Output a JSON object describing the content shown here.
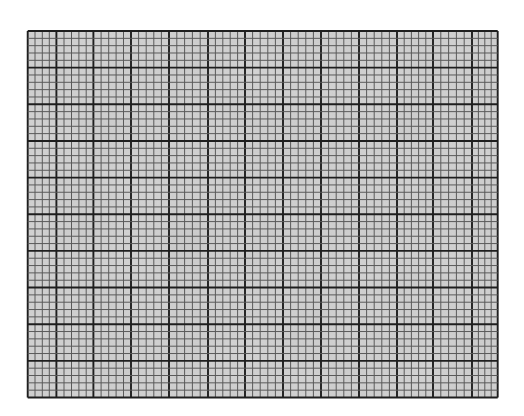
{
  "graph_paper": {
    "background": "#ffffff",
    "grid": {
      "left": 27.7,
      "top": 31.0,
      "right": 497.7,
      "bottom": 397.5,
      "fill": "#d6d6d6",
      "minor_line_color": "#5a5a5a",
      "major_line_color": "#1e1e1e",
      "minor_line_width": 1.0,
      "major_line_width": 1.9,
      "vertical_lines_x": [
        27.7,
        35.0,
        42.3,
        49.3,
        56.4,
        64.0,
        71.5,
        78.9,
        86.2,
        93.4,
        101.1,
        108.7,
        116.1,
        123.5,
        131.0,
        138.6,
        146.2,
        153.8,
        161.4,
        169.0,
        176.8,
        184.6,
        192.4,
        200.2,
        208.0,
        215.4,
        222.8,
        230.2,
        237.6,
        245.0,
        252.6,
        260.2,
        267.8,
        275.4,
        283.0,
        290.6,
        298.2,
        305.8,
        313.4,
        321.0,
        328.6,
        336.2,
        343.8,
        351.4,
        359.0,
        366.6,
        374.2,
        381.8,
        389.4,
        397.0,
        404.2,
        411.4,
        418.6,
        425.8,
        433.0,
        440.8,
        448.6,
        456.4,
        464.2,
        472.0,
        478.4,
        484.8,
        491.2,
        497.7
      ],
      "vertical_major_x": [
        27.7,
        56.4,
        93.4,
        131.0,
        169.0,
        208.0,
        245.0,
        283.0,
        321.0,
        359.0,
        397.0,
        433.0,
        472.0,
        497.7
      ],
      "rows": 50,
      "major_every_rows": 5
    }
  }
}
